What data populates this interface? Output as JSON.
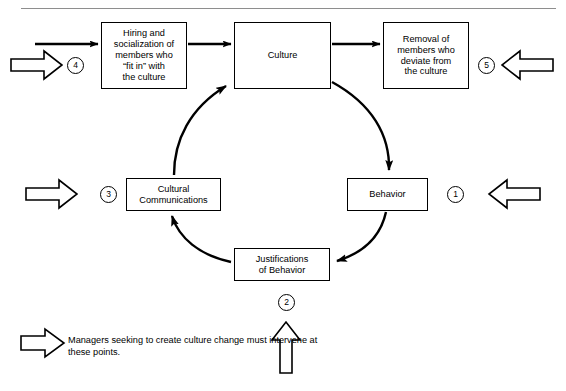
{
  "figure": {
    "title_rule": "horizontal-rule",
    "nodes": {
      "hiring": "Hiring and socialization of members who \"fit in\" with the culture",
      "hiring_lines": [
        "Hiring and",
        "socialization of",
        "members who",
        "“fit in” with",
        "the culture"
      ],
      "culture": "Culture",
      "culture_lines": [
        "Culture"
      ],
      "removal": "Removal of members who deviate from the culture",
      "removal_lines": [
        "Removal of",
        "members who",
        "deviate from",
        "the culture"
      ],
      "communications": "Cultural Communications",
      "communications_lines": [
        "Cultural",
        "Communications"
      ],
      "behavior": "Behavior",
      "behavior_lines": [
        "Behavior"
      ],
      "justifications": "Justifications of Behavior",
      "justifications_lines": [
        "Justifications",
        "of Behavior"
      ]
    },
    "markers": {
      "one": "1",
      "two": "2",
      "three": "3",
      "four": "4",
      "five": "5"
    },
    "caption": "Managers seeking to create culture change must intervene at these points.",
    "caption_lines": [
      "Managers seeking to create culture",
      "change must intervene at these points."
    ],
    "colors": {
      "stroke": "#000000",
      "background": "#ffffff",
      "rule": "#8e8e8e"
    },
    "flow": {
      "solid_arrows": [
        "entry → Hiring and socialization",
        "Hiring and socialization → Culture",
        "Culture → Removal of members",
        "Culture → Behavior",
        "Behavior → Justifications of Behavior",
        "Justifications of Behavior → Cultural Communications",
        "Cultural Communications → Culture"
      ],
      "hollow_arrows": [
        "left hollow arrow at marker 4 (pointing right)",
        "left hollow arrow at marker 3 (pointing right)",
        "right hollow arrow at marker 5 (pointing left)",
        "right hollow arrow at marker 1 (pointing left)",
        "bottom hollow arrow at marker 2 (pointing up)",
        "legend hollow arrow (pointing right)"
      ]
    }
  }
}
